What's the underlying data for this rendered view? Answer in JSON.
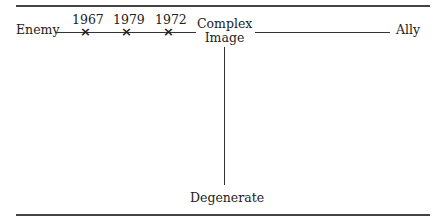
{
  "diagram": {
    "axis_horizontal": {
      "left_label": "Enemy",
      "right_label": "Ally"
    },
    "center_label_line1": "Complex",
    "center_label_line2": "Image",
    "axis_vertical": {
      "bottom_label": "Degenerate"
    },
    "marks": [
      {
        "year": "1967",
        "symbol": "x"
      },
      {
        "year": "1979",
        "symbol": "x"
      },
      {
        "year": "1972",
        "symbol": "x"
      }
    ]
  }
}
